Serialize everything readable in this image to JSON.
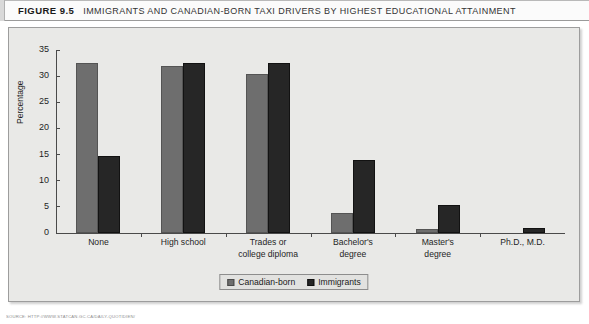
{
  "caption": {
    "figure_label": "FIGURE 9.5",
    "title": "IMMIGRANTS AND CANADIAN-BORN TAXI DRIVERS BY HIGHEST EDUCATIONAL ATTAINMENT"
  },
  "legend": {
    "items": [
      {
        "label": "Canadian-born",
        "color": "#6e6e6e"
      },
      {
        "label": "Immigrants",
        "color": "#262626"
      }
    ]
  },
  "source": "SOURCE: HTTP://WWW.STATCAN.GC.CA/DAILY-QUOTIDIEN/",
  "chart_data": {
    "type": "bar",
    "title": "IMMIGRANTS AND CANADIAN-BORN TAXI DRIVERS BY HIGHEST EDUCATIONAL ATTAINMENT",
    "xlabel": "",
    "ylabel": "Percentage",
    "ylim": [
      0,
      35
    ],
    "yticks": [
      0,
      5,
      10,
      15,
      20,
      25,
      30,
      35
    ],
    "grid": false,
    "legend_position": "bottom-center",
    "categories": [
      "None",
      "High school",
      "Trades or college diploma",
      "Bachelor's degree",
      "Master's degree",
      "Ph.D., M.D."
    ],
    "category_lines": [
      [
        "None"
      ],
      [
        "High school"
      ],
      [
        "Trades or",
        "college diploma"
      ],
      [
        "Bachelor's",
        "degree"
      ],
      [
        "Master's",
        "degree"
      ],
      [
        "Ph.D., M.D."
      ]
    ],
    "series": [
      {
        "name": "Canadian-born",
        "color": "#6e6e6e",
        "values": [
          32.5,
          32.0,
          30.4,
          3.9,
          0.8,
          0.0
        ]
      },
      {
        "name": "Immigrants",
        "color": "#262626",
        "values": [
          14.8,
          32.6,
          32.6,
          14.0,
          5.4,
          0.9
        ]
      }
    ]
  }
}
